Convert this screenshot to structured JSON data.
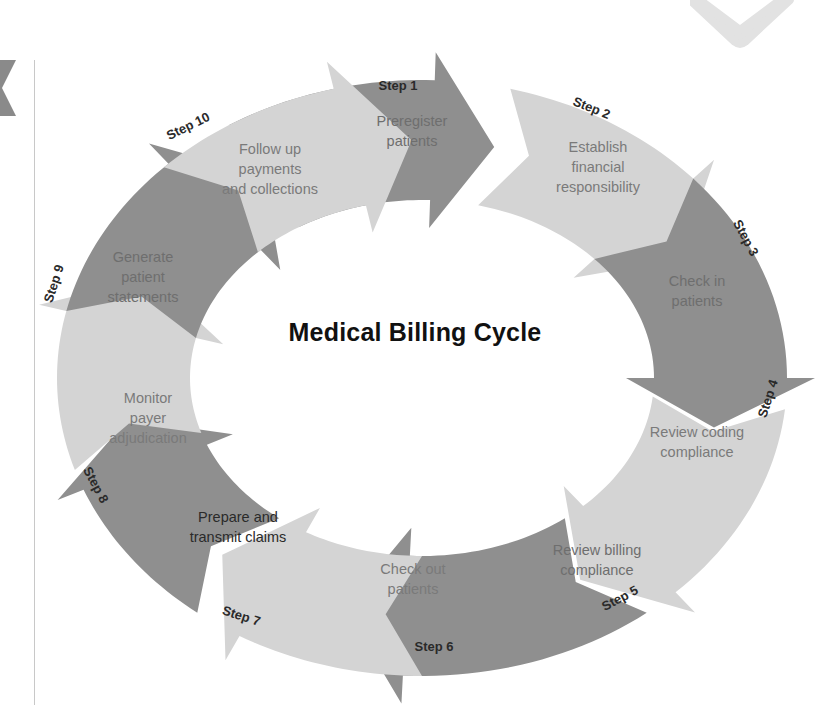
{
  "title": "Medical Billing Cycle",
  "colors": {
    "dark": "#8f8f8f",
    "light": "#d4d4d4",
    "text_on_dark": "#6e6e6e",
    "text_on_light": "#7a7a7a",
    "label": "#2a2a2a",
    "background": "#ffffff"
  },
  "ring": {
    "cx": 422,
    "cy": 378,
    "outer_rx": 365,
    "outer_ry": 298,
    "inner_rx": 232,
    "inner_ry": 178
  },
  "steps": [
    {
      "step": "Step 1",
      "label": [
        "Preregister",
        "patients"
      ],
      "shade": "dark",
      "text_x": 412,
      "text_y": 126,
      "step_x": 398,
      "step_y": 90,
      "step_rot": 0,
      "text_color": "text_on_dark"
    },
    {
      "step": "Step 2",
      "label": [
        "Establish",
        "financial",
        "responsibility"
      ],
      "shade": "light",
      "text_x": 598,
      "text_y": 152,
      "step_x": 590,
      "step_y": 112,
      "step_rot": 22,
      "text_color": "text_on_light"
    },
    {
      "step": "Step 3",
      "label": [
        "Check in",
        "patients"
      ],
      "shade": "dark",
      "text_x": 697,
      "text_y": 286,
      "step_x": 742,
      "step_y": 240,
      "step_rot": 62,
      "text_color": "text_on_dark"
    },
    {
      "step": "Step 4",
      "label": [
        "Review coding",
        "compliance"
      ],
      "shade": "light",
      "text_x": 697,
      "text_y": 437,
      "step_x": 772,
      "step_y": 400,
      "step_rot": -72,
      "text_color": "text_on_light"
    },
    {
      "step": "Step 5",
      "label": [
        "Review billing",
        "compliance"
      ],
      "shade": "dark",
      "text_x": 597,
      "text_y": 555,
      "step_x": 622,
      "step_y": 602,
      "step_rot": -28,
      "text_color": "text_on_dark"
    },
    {
      "step": "Step 6",
      "label": [
        "Check out",
        "patients"
      ],
      "shade": "light",
      "text_x": 413,
      "text_y": 574,
      "step_x": 434,
      "step_y": 651,
      "step_rot": 0,
      "text_color": "text_on_light"
    },
    {
      "step": "Step 7",
      "label": [
        "Prepare and",
        "transmit claims"
      ],
      "shade": "dark",
      "text_x": 238,
      "text_y": 522,
      "step_x": 240,
      "step_y": 620,
      "step_rot": 18,
      "text_color": "label"
    },
    {
      "step": "Step 8",
      "label": [
        "Monitor",
        "payer",
        "adjudication"
      ],
      "shade": "light",
      "text_x": 148,
      "text_y": 403,
      "step_x": 92,
      "step_y": 487,
      "step_rot": 62,
      "text_color": "text_on_light"
    },
    {
      "step": "Step 9",
      "label": [
        "Generate",
        "patient",
        "statements"
      ],
      "shade": "dark",
      "text_x": 143,
      "text_y": 262,
      "step_x": 58,
      "step_y": 285,
      "step_rot": -72,
      "text_color": "text_on_dark"
    },
    {
      "step": "Step 10",
      "label": [
        "Follow up",
        "payments",
        "and collections"
      ],
      "shade": "light",
      "text_x": 270,
      "text_y": 154,
      "step_x": 190,
      "step_y": 130,
      "step_rot": -26,
      "text_color": "text_on_light"
    }
  ],
  "arrows_deg": [
    {
      "from": 238,
      "to": 284
    },
    {
      "from": 284,
      "to": 330
    },
    {
      "from": 318,
      "to": 12
    },
    {
      "from": 6,
      "to": 58
    },
    {
      "from": 52,
      "to": 105
    },
    {
      "from": 90,
      "to": 132
    },
    {
      "from": 128,
      "to": 170
    },
    {
      "from": 162,
      "to": 205
    },
    {
      "from": 193,
      "to": 238
    },
    {
      "from": 225,
      "to": 268
    }
  ]
}
